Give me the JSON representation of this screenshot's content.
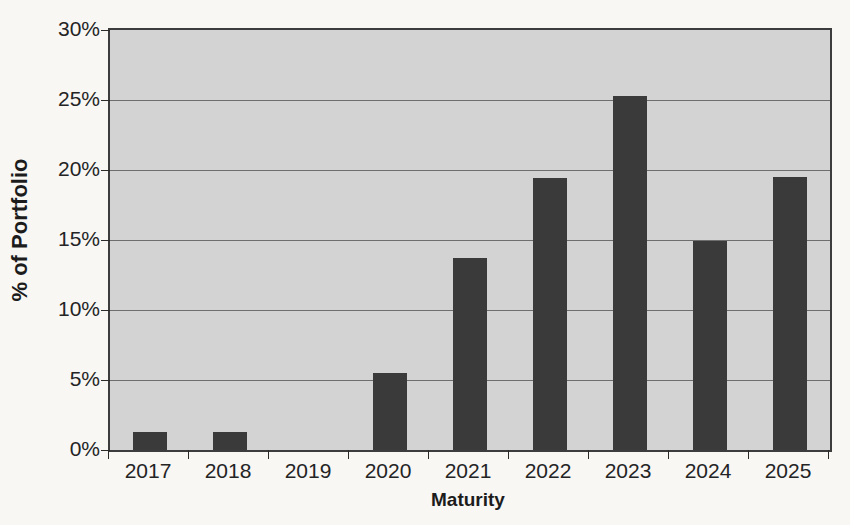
{
  "chart_data": {
    "type": "bar",
    "title": "",
    "xlabel": "Maturity",
    "ylabel": "% of Portfolio",
    "categories": [
      "2017",
      "2018",
      "2019",
      "2020",
      "2021",
      "2022",
      "2023",
      "2024",
      "2025"
    ],
    "values": [
      1.3,
      1.3,
      0,
      5.5,
      13.7,
      19.4,
      25.3,
      14.9,
      19.5
    ],
    "ylim": [
      0,
      30
    ],
    "ytick_values": [
      0,
      5,
      10,
      15,
      20,
      25,
      30
    ],
    "ytick_labels": [
      "0%",
      "5%",
      "10%",
      "15%",
      "20%",
      "25%",
      "30%"
    ],
    "grid": true,
    "grid_axis": "y",
    "legend": false,
    "legend_position": "none",
    "bar_color": "#3a3a3a",
    "plot_background_color": "#d3d3d3",
    "page_background_color": "#f8f7f4",
    "axis_color": "#3c3c3c",
    "gridline_color": "#6e6e6e",
    "series": [
      {
        "name": "% of Portfolio",
        "values": [
          1.3,
          1.3,
          0,
          5.5,
          13.7,
          19.4,
          25.3,
          14.9,
          19.5
        ]
      }
    ]
  }
}
